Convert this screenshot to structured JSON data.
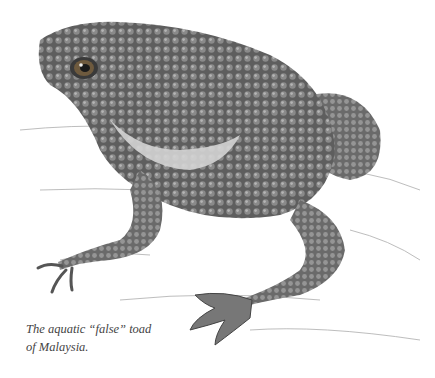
{
  "image": {
    "subject": "toad illustration",
    "caption_line1": "The aquatic “false” toad",
    "caption_line2": "of Malaysia."
  }
}
